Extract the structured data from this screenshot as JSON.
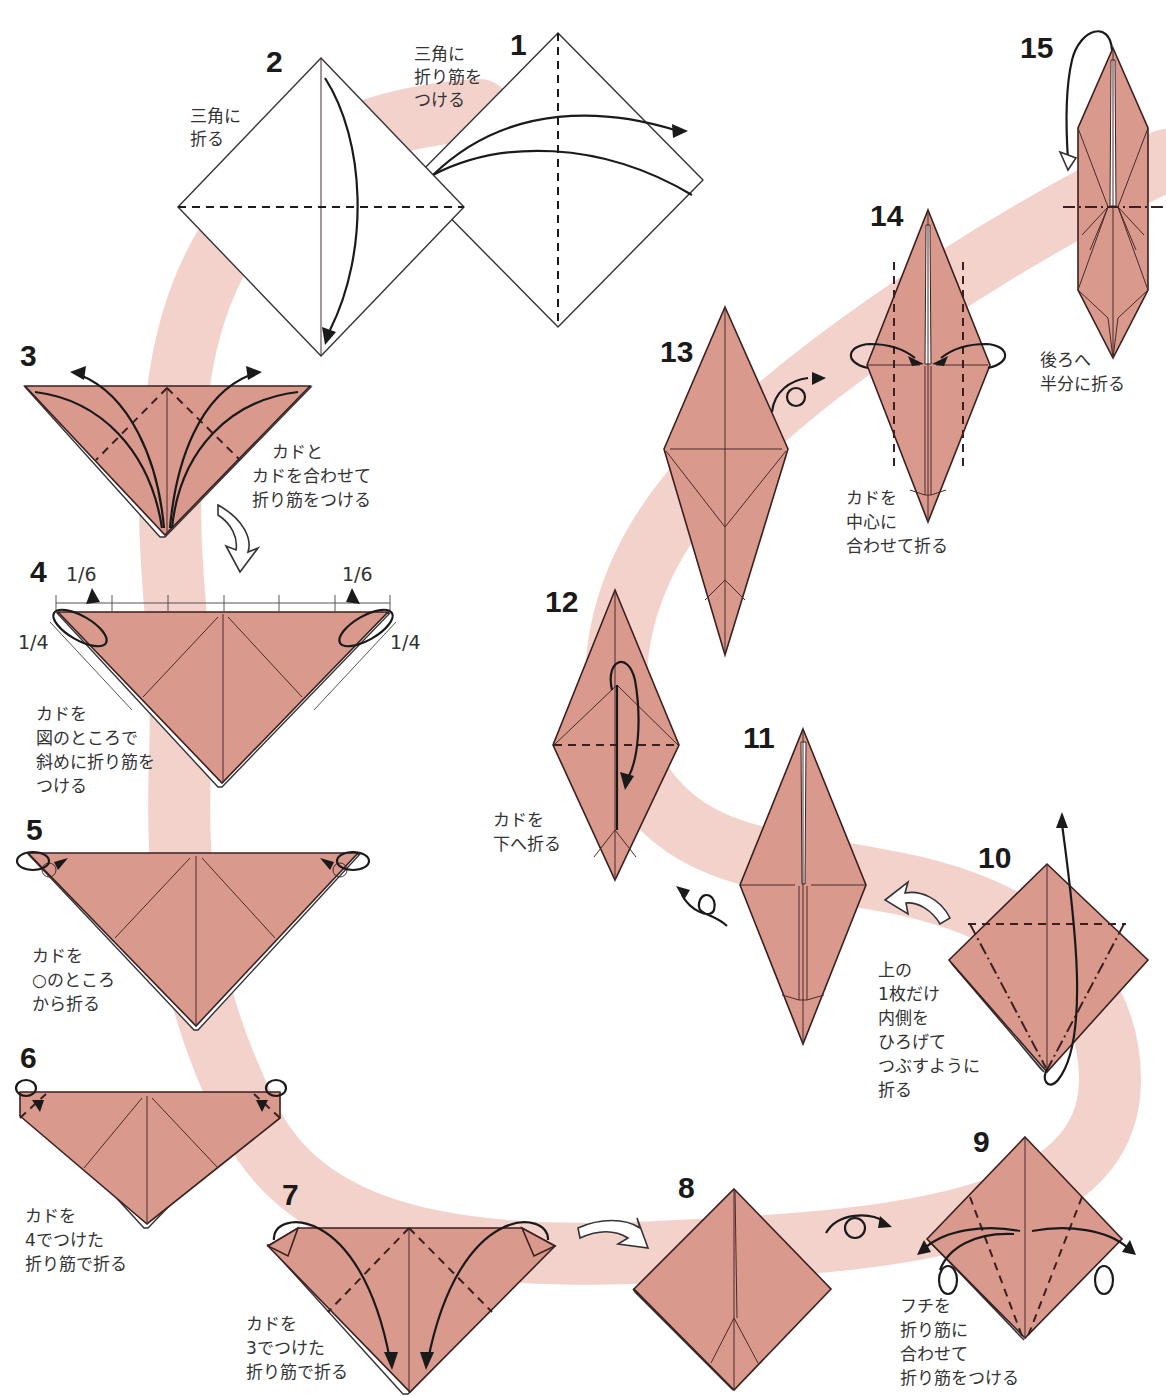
{
  "colors": {
    "paper": "#d9998c",
    "ribbon": "#f2cdc7",
    "line": "#3b2020",
    "text": "#333333"
  },
  "steps": [
    {
      "num": "1",
      "caption": [
        "三角に",
        "折り筋を",
        "つける"
      ]
    },
    {
      "num": "2",
      "caption": [
        "三角に",
        "折る"
      ]
    },
    {
      "num": "3",
      "caption": [
        "カドと",
        "カドを合わせて",
        "折り筋をつける"
      ]
    },
    {
      "num": "4",
      "caption": [
        "カドを",
        "図のところで",
        "斜めに折り筋を",
        "つける"
      ],
      "fractions": {
        "top_left": "1/6",
        "top_right": "1/6",
        "side_left": "1/4",
        "side_right": "1/4"
      }
    },
    {
      "num": "5",
      "caption": [
        "カドを",
        "○のところ",
        "から折る"
      ]
    },
    {
      "num": "6",
      "caption": [
        "カドを",
        "4でつけた",
        "折り筋で折る"
      ]
    },
    {
      "num": "7",
      "caption": [
        "カドを",
        "3でつけた",
        "折り筋で折る"
      ]
    },
    {
      "num": "8",
      "caption": []
    },
    {
      "num": "9",
      "caption": [
        "フチを",
        "折り筋に",
        "合わせて",
        "折り筋をつける"
      ]
    },
    {
      "num": "10",
      "caption": [
        "上の",
        "1枚だけ",
        "内側を",
        "ひろげて",
        "つぶすように",
        "折る"
      ]
    },
    {
      "num": "11",
      "caption": []
    },
    {
      "num": "12",
      "caption": [
        "カドを",
        "下へ折る"
      ]
    },
    {
      "num": "13",
      "caption": []
    },
    {
      "num": "14",
      "caption": [
        "カドを",
        "中心に",
        "合わせて折る"
      ]
    },
    {
      "num": "15",
      "caption": [
        "後ろへ",
        "半分に折る"
      ]
    }
  ],
  "icons": {
    "turn_over": "turn-over-icon",
    "next_step": "hollow-next-arrow-icon",
    "fold_arrow": "fold-arrow-icon"
  }
}
